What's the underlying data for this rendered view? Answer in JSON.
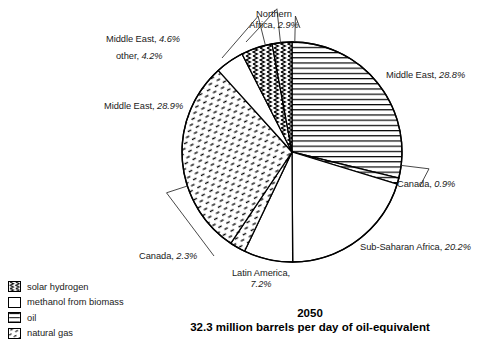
{
  "chart_data": {
    "type": "pie",
    "title": "2050",
    "subtitle": "32.3 million barrels per day of oil-equivalent",
    "start_angle_deg": 0,
    "direction": "clockwise",
    "total_label": "32.3 million barrels per day of oil-equivalent",
    "year": "2050",
    "categories": [
      "Middle East",
      "Canada",
      "Sub-Saharan Africa",
      "Latin America",
      "Canada",
      "Middle East",
      "other",
      "Middle East",
      "Northern Africa"
    ],
    "values": [
      28.8,
      0.9,
      20.2,
      7.2,
      2.3,
      28.9,
      4.2,
      4.6,
      2.9
    ],
    "slices": [
      {
        "id": "middle-east-oil",
        "region": "Middle East",
        "percent": 28.8,
        "percent_text": "28.8%",
        "label": "Middle East, 28.8%",
        "fuel": "oil",
        "pattern": "horizontal-lines"
      },
      {
        "id": "canada-oil",
        "region": "Canada",
        "percent": 0.9,
        "percent_text": "0.9%",
        "label": "Canada, 0.9%",
        "fuel": "oil",
        "pattern": "horizontal-lines"
      },
      {
        "id": "subsaharan-africa",
        "region": "Sub-Saharan Africa",
        "percent": 20.2,
        "percent_text": "20.2%",
        "label": "Sub-Saharan Africa, 20.2%",
        "fuel": "methanol from biomass",
        "pattern": "blank"
      },
      {
        "id": "latin-america",
        "region": "Latin America",
        "percent": 7.2,
        "percent_text": "7.2%",
        "label": "Latin America, 7.2%",
        "fuel": "methanol from biomass",
        "pattern": "blank"
      },
      {
        "id": "canada-gas",
        "region": "Canada",
        "percent": 2.3,
        "percent_text": "2.3%",
        "label": "Canada, 2.3%",
        "fuel": "natural gas",
        "pattern": "dashes"
      },
      {
        "id": "middle-east-gas",
        "region": "Middle East",
        "percent": 28.9,
        "percent_text": "28.9%",
        "label": "Middle East, 28.9%",
        "fuel": "natural gas",
        "pattern": "dashes"
      },
      {
        "id": "other",
        "region": "other",
        "percent": 4.2,
        "percent_text": "4.2%",
        "label": "other, 4.2%",
        "fuel": "methanol from biomass",
        "pattern": "blank"
      },
      {
        "id": "middle-east-sh",
        "region": "Middle East",
        "percent": 4.6,
        "percent_text": "4.6%",
        "label": "Middle East, 4.6%",
        "fuel": "solar hydrogen",
        "pattern": "zigzag"
      },
      {
        "id": "northern-africa",
        "region": "Northern Africa",
        "percent": 2.9,
        "percent_text": "2.9%",
        "label": "Northern Africa, 2.9%",
        "fuel": "solar hydrogen",
        "pattern": "zigzag"
      }
    ],
    "legend": {
      "position": "bottom-left",
      "entries": [
        {
          "label": "solar hydrogen",
          "pattern": "zigzag",
          "swatch_name": "swatch-solar-hydrogen"
        },
        {
          "label": "methanol from biomass",
          "pattern": "blank",
          "swatch_name": "swatch-methanol-from-biomass"
        },
        {
          "label": "oil",
          "pattern": "horizontal-lines",
          "swatch_name": "swatch-oil"
        },
        {
          "label": "natural gas",
          "pattern": "dashes",
          "swatch_name": "swatch-natural-gas"
        }
      ]
    },
    "colors": {
      "stroke": "#000000",
      "background": "#ffffff",
      "text": "#1a1a1a"
    },
    "labels": {
      "northern_africa_line1": "Northern",
      "northern_africa_line2": "Africa, 2.9%",
      "latin_america_line1": "Latin America,",
      "latin_america_line2": "7.2%"
    }
  }
}
